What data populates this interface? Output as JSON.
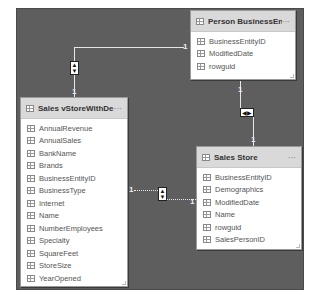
{
  "diagram": {
    "type": "relationship-model-view",
    "tables": [
      {
        "id": "person-businessentity",
        "title": "Person BusinessEntity",
        "menu": "···",
        "fields": [
          "BusinessEntityID",
          "ModifiedDate",
          "rowguid"
        ]
      },
      {
        "id": "sales-vstorewithdemographics",
        "title": "Sales vStoreWithDe...",
        "menu": "···",
        "fields": [
          "AnnualRevenue",
          "AnnualSales",
          "BankName",
          "Brands",
          "BusinessEntityID",
          "BusinessType",
          "Internet",
          "Name",
          "NumberEmployees",
          "Specialty",
          "SquareFeet",
          "StoreSize",
          "YearOpened"
        ]
      },
      {
        "id": "sales-store",
        "title": "Sales Store",
        "menu": "···",
        "fields": [
          "BusinessEntityID",
          "Demographics",
          "ModifiedDate",
          "Name",
          "rowguid",
          "SalesPersonID"
        ]
      }
    ],
    "relationships": [
      {
        "from": "Person BusinessEntity",
        "to": "Sales vStoreWithDe...",
        "from_cardinality": "1",
        "to_cardinality": "1",
        "cross_filter": "both",
        "style": "solid"
      },
      {
        "from": "Person BusinessEntity",
        "to": "Sales Store",
        "from_cardinality": "1",
        "to_cardinality": "1",
        "cross_filter": "both",
        "style": "solid"
      },
      {
        "from": "Sales vStoreWithDe...",
        "to": "Sales Store",
        "from_cardinality": "1",
        "to_cardinality": "1",
        "cross_filter": "both",
        "style": "dotted"
      }
    ],
    "icons": {
      "table": "table-icon",
      "field": "field-icon",
      "cross_filter_vertical": "▲▼",
      "cross_filter_horizontal": "◀▶",
      "up": "▲",
      "down": "▼",
      "left": "◀",
      "right": "▶"
    },
    "colors": {
      "canvas": "#5e5e5e",
      "header": "#d9d9d9",
      "card": "#ffffff",
      "line": "#e6e6e6",
      "field_text": "#555555"
    }
  }
}
